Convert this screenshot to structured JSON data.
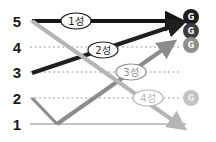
{
  "chart_data": {
    "type": "line",
    "title": "",
    "xlabel": "",
    "ylabel": "",
    "ylim": [
      1,
      5
    ],
    "grid": true,
    "legend_position": "inline-on-line",
    "y_tick_labels": [
      "5",
      "4",
      "3",
      "2",
      "1"
    ],
    "y_tick_values": [
      5,
      4,
      3,
      2,
      1
    ],
    "y_tick_pixels": [
      21,
      47,
      72,
      98,
      124
    ],
    "gridline_styles": [
      "solid",
      "dotted",
      "dotted",
      "dotted",
      "solid"
    ],
    "series": [
      {
        "name": "1성",
        "label": "1성",
        "color": "#141414",
        "width": 4.2,
        "start_level": 5,
        "end_level": 5,
        "arrow": true,
        "points": [
          [
            32,
            21
          ],
          [
            174,
            21
          ]
        ],
        "label_pos": [
          76,
          21
        ]
      },
      {
        "name": "2성",
        "label": "2성",
        "color": "#1f1f1f",
        "width": 4.0,
        "start_level": 3,
        "end_level": 5,
        "arrow": true,
        "points": [
          [
            32,
            73
          ],
          [
            176,
            25
          ]
        ],
        "label_pos": [
          103,
          50
        ]
      },
      {
        "name": "3성",
        "label": "3성",
        "color": "#8c8c8c",
        "width": 4.0,
        "start_level": 1,
        "end_level": 4,
        "arrow": true,
        "points": [
          [
            57,
            124
          ],
          [
            168,
            46
          ]
        ],
        "label_pos": [
          131,
          72
        ]
      },
      {
        "name": "4성",
        "label": "4성",
        "color": "#b5b5b5",
        "width": 4.0,
        "start_level": 5,
        "end_level": 1,
        "arrow": true,
        "points": [
          [
            32,
            21
          ],
          [
            178,
            124
          ]
        ],
        "label_pos": [
          148,
          98
        ]
      },
      {
        "name": "drop-segment",
        "label": "",
        "color": "#8c8c8c",
        "width": 3.2,
        "start_level": 2,
        "end_level": 1,
        "arrow": false,
        "points": [
          [
            32,
            98
          ],
          [
            57,
            124
          ]
        ],
        "label_pos": [
          0,
          0
        ]
      }
    ],
    "end_badges": [
      {
        "glyph": "G",
        "fill": "#1c1c1c",
        "text_color": "#ffffff",
        "cx": 191,
        "cy": 17,
        "r": 8
      },
      {
        "glyph": "G",
        "fill": "#3d3d3d",
        "text_color": "#ffffff",
        "cx": 191,
        "cy": 31,
        "r": 8
      },
      {
        "glyph": "G",
        "fill": "#8e8e8e",
        "text_color": "#ffffff",
        "cx": 191,
        "cy": 45,
        "r": 8
      },
      {
        "glyph": "G",
        "fill": "#c2c2c2",
        "text_color": "#f2f2f2",
        "cx": 191,
        "cy": 98,
        "r": 8
      }
    ],
    "label_ellipse": {
      "rx": 15,
      "ry": 8,
      "fill": "#ffffff",
      "stroke_widths": [
        1.2,
        1.2,
        1.2,
        1.2
      ]
    },
    "axis_label_x": 17
  }
}
